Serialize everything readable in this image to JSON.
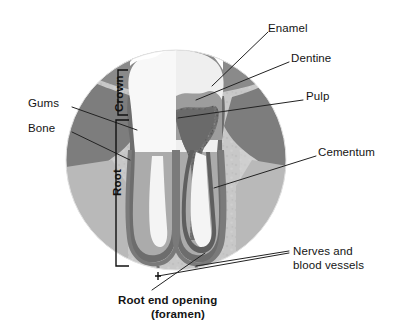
{
  "figure": {
    "shape": "circular-inset",
    "colors": {
      "background": "#ffffff",
      "upper_background": "#8a8a8a",
      "bone": "#c9c9c9",
      "gum": "#7d7d7d",
      "enamel": "#f7f7f7",
      "dentine": "#ababab",
      "pulp": "#6f6f6f",
      "cementum": "#8e8e8e",
      "canal": "#f2f2f2",
      "leader_line": "#222222",
      "text": "#141414"
    }
  },
  "labels": {
    "enamel": "Enamel",
    "dentine": "Dentine",
    "pulp": "Pulp",
    "cementum": "Cementum",
    "gums": "Gums",
    "bone": "Bone",
    "nerves_line1": "Nerves and",
    "nerves_line2": "blood vessels",
    "foramen_line1": "Root end opening",
    "foramen_line2": "(foramen)",
    "crown": "Crown",
    "root": "Root"
  },
  "brackets": {
    "crown": {
      "label": "Crown",
      "top": 70,
      "bottom": 115
    },
    "root": {
      "label": "Root",
      "top": 120,
      "bottom": 266
    }
  },
  "parts": [
    {
      "name": "Enamel",
      "description": "Hard white outer layer of the crown"
    },
    {
      "name": "Dentine",
      "description": "Mid-grey layer beneath the enamel"
    },
    {
      "name": "Pulp",
      "description": "Dark textured core containing nerves and vessels"
    },
    {
      "name": "Cementum",
      "description": "Thin layer covering the root surface"
    },
    {
      "name": "Gums",
      "description": "Soft tissue around the neck of the tooth"
    },
    {
      "name": "Bone",
      "description": "Alveolar bone supporting the root"
    },
    {
      "name": "Nerves and blood vessels",
      "description": "Enter through the root end opening"
    },
    {
      "name": "Root end opening (foramen)",
      "description": "Aperture at the root apex"
    }
  ]
}
